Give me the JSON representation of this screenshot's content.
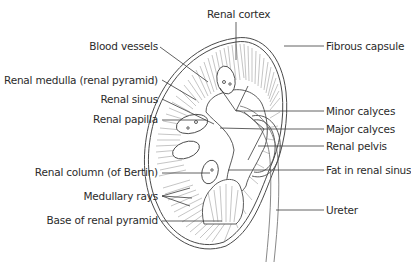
{
  "diagram": {
    "colors": {
      "line": "#4a4a4a",
      "text": "#2b2b2b",
      "background": "#ffffff"
    },
    "labels": {
      "renal_cortex": "Renal cortex",
      "blood_vessels": "Blood vessels",
      "renal_medulla": "Renal medulla (renal pyramid)",
      "renal_sinus": "Renal sinus",
      "renal_papilla": "Renal papilla",
      "renal_column": "Renal column (of Bertin)",
      "medullary_rays": "Medullary rays",
      "base_of_renal_pyramid": "Base of renal pyramid",
      "fibrous_capsule": "Fibrous capsule",
      "minor_calyces": "Minor calyces",
      "major_calyces": "Major calyces",
      "renal_pelvis": "Renal pelvis",
      "fat_in_renal_sinus": "Fat in renal sinus",
      "ureter": "Ureter"
    }
  }
}
